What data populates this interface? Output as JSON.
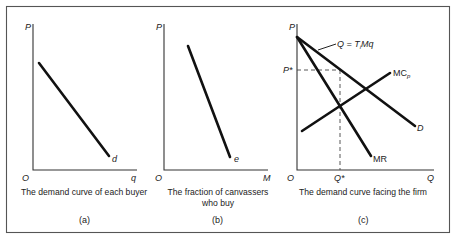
{
  "figure": {
    "panels": [
      {
        "id": "a",
        "tag": "(a)",
        "caption_lines": [
          "The demand curve of each buyer"
        ],
        "y_axis_label": "P",
        "x_axis_label": "q",
        "origin_label": "O",
        "curves": [
          {
            "name": "d",
            "label": "d",
            "description": "individual buyer demand, downward sloping"
          }
        ]
      },
      {
        "id": "b",
        "tag": "(b)",
        "caption_lines": [
          "The fraction of canvassers",
          "who buy"
        ],
        "y_axis_label": "P",
        "x_axis_label": "M",
        "origin_label": "O",
        "curves": [
          {
            "name": "e",
            "label": "e",
            "description": "fraction of canvassers who buy, steeply downward sloping"
          }
        ]
      },
      {
        "id": "c",
        "tag": "(c)",
        "caption_lines": [
          "The demand curve facing the firm"
        ],
        "y_axis_label": "P",
        "x_axis_label": "Q",
        "origin_label": "O",
        "p_star_label": "P*",
        "q_star_label": "Q*",
        "curves": [
          {
            "name": "D",
            "label": "D",
            "annotation": "Q = T",
            "annotation_sub": "i",
            "annotation_tail": "Mq"
          },
          {
            "name": "MR",
            "label": "MR"
          },
          {
            "name": "MC",
            "label": "MC",
            "label_sub": "p"
          }
        ]
      }
    ]
  }
}
